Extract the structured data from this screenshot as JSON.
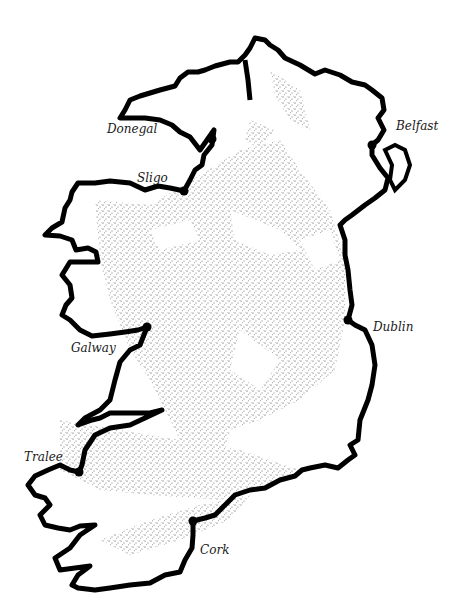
{
  "map": {
    "title": "Ireland",
    "colors": {
      "coastline": "#000000",
      "land": "#ffffff",
      "stipple": "#555555",
      "label": "#1a1a1a",
      "city_marker": "#000000"
    },
    "cities": [
      {
        "name": "Donegal",
        "dot": [
          212,
          139
        ],
        "label": [
          107,
          123
        ]
      },
      {
        "name": "Sligo",
        "dot": [
          184,
          191
        ],
        "label": [
          137,
          172
        ]
      },
      {
        "name": "Belfast",
        "dot": [
          372,
          145
        ],
        "label": [
          396,
          120
        ]
      },
      {
        "name": "Dublin",
        "dot": [
          348,
          320
        ],
        "label": [
          373,
          321
        ]
      },
      {
        "name": "Galway",
        "dot": [
          147,
          327
        ],
        "label": [
          71,
          342
        ]
      },
      {
        "name": "Tralee",
        "dot": [
          79,
          472
        ],
        "label": [
          24,
          451
        ]
      },
      {
        "name": "Cork",
        "dot": [
          193,
          521
        ],
        "label": [
          200,
          544
        ]
      }
    ]
  }
}
